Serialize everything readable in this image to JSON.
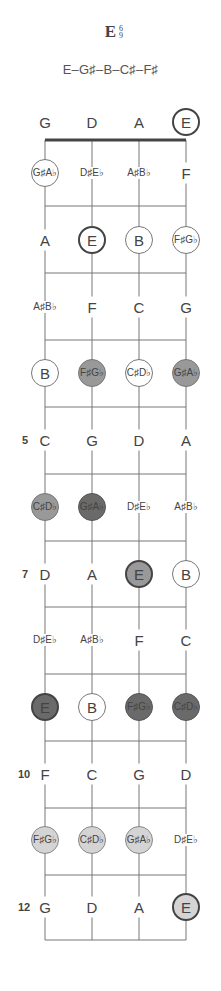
{
  "chord": {
    "name": "E",
    "superscript_top": "6",
    "superscript_bottom": "9",
    "notes_formula": "E–G♯–B–C♯–F♯"
  },
  "diagram": {
    "strings": [
      "G",
      "D",
      "A",
      "E"
    ],
    "string_x": [
      45,
      92,
      139,
      186
    ],
    "nut_y": 140,
    "fret_line_y": [
      206,
      273,
      340,
      407,
      474,
      541,
      607,
      674,
      741,
      808,
      875,
      940
    ],
    "row_y": [
      122,
      173,
      240,
      307,
      373,
      440,
      507,
      574,
      640,
      707,
      774,
      840,
      907
    ],
    "fret_numbers": [
      {
        "row": 5,
        "label": "5"
      },
      {
        "row": 7,
        "label": "7"
      },
      {
        "row": 10,
        "label": "10"
      },
      {
        "row": 12,
        "label": "12"
      }
    ],
    "colors": {
      "line": "#777777",
      "nut": "#444444",
      "light_fill": "#d4d4d4",
      "mid_fill": "#999999",
      "dark_fill": "#6a6a6a"
    },
    "rows": [
      [
        {
          "text": "G",
          "style": "plain"
        },
        {
          "text": "D",
          "style": "plain"
        },
        {
          "text": "A",
          "style": "plain"
        },
        {
          "text": "E",
          "style": "root"
        }
      ],
      [
        {
          "text": "G♯|A♭",
          "style": "white"
        },
        {
          "text": "D♯|E♭",
          "style": "plain"
        },
        {
          "text": "A♯|B♭",
          "style": "plain"
        },
        {
          "text": "F",
          "style": "plain"
        }
      ],
      [
        {
          "text": "A",
          "style": "plain"
        },
        {
          "text": "E",
          "style": "root"
        },
        {
          "text": "B",
          "style": "white"
        },
        {
          "text": "F♯|G♭",
          "style": "white"
        }
      ],
      [
        {
          "text": "A♯|B♭",
          "style": "plain"
        },
        {
          "text": "F",
          "style": "plain"
        },
        {
          "text": "C",
          "style": "plain"
        },
        {
          "text": "G",
          "style": "plain"
        }
      ],
      [
        {
          "text": "B",
          "style": "white"
        },
        {
          "text": "F♯|G♭",
          "style": "mid"
        },
        {
          "text": "C♯|D♭",
          "style": "white"
        },
        {
          "text": "G♯|A♭",
          "style": "mid"
        }
      ],
      [
        {
          "text": "C",
          "style": "plain"
        },
        {
          "text": "G",
          "style": "plain"
        },
        {
          "text": "D",
          "style": "plain"
        },
        {
          "text": "A",
          "style": "plain"
        }
      ],
      [
        {
          "text": "C♯|D♭",
          "style": "mid"
        },
        {
          "text": "G♯|A♭",
          "style": "dark"
        },
        {
          "text": "D♯|E♭",
          "style": "plain"
        },
        {
          "text": "A♯|B♭",
          "style": "plain"
        }
      ],
      [
        {
          "text": "D",
          "style": "plain"
        },
        {
          "text": "A",
          "style": "plain"
        },
        {
          "text": "E",
          "style": "root-mid"
        },
        {
          "text": "B",
          "style": "white"
        }
      ],
      [
        {
          "text": "D♯|E♭",
          "style": "plain"
        },
        {
          "text": "A♯|B♭",
          "style": "plain"
        },
        {
          "text": "F",
          "style": "plain"
        },
        {
          "text": "C",
          "style": "plain"
        }
      ],
      [
        {
          "text": "E",
          "style": "root-dark"
        },
        {
          "text": "B",
          "style": "white"
        },
        {
          "text": "F♯|G♭",
          "style": "dark"
        },
        {
          "text": "C♯|D♭",
          "style": "dark"
        }
      ],
      [
        {
          "text": "F",
          "style": "plain"
        },
        {
          "text": "C",
          "style": "plain"
        },
        {
          "text": "G",
          "style": "plain"
        },
        {
          "text": "D",
          "style": "plain"
        }
      ],
      [
        {
          "text": "F♯|G♭",
          "style": "light"
        },
        {
          "text": "C♯|D♭",
          "style": "light"
        },
        {
          "text": "G♯|A♭",
          "style": "light"
        },
        {
          "text": "D♯|E♭",
          "style": "plain"
        }
      ],
      [
        {
          "text": "G",
          "style": "plain"
        },
        {
          "text": "D",
          "style": "plain"
        },
        {
          "text": "A",
          "style": "plain"
        },
        {
          "text": "E",
          "style": "root-light"
        }
      ]
    ]
  }
}
